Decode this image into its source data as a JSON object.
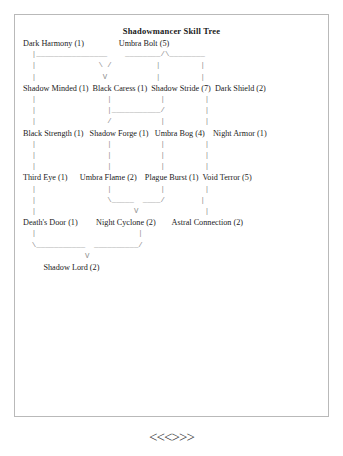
{
  "card": {
    "title": "Shadowmancer Skill Tree"
  },
  "tree": {
    "rows": [
      {
        "kind": "label",
        "text": "Dark Harmony (1)                 Umbra Bolt (5)"
      },
      {
        "kind": "conn",
        "text": "  |________________    ________/\\________"
      },
      {
        "kind": "conn",
        "text": "  |              \\ /          |         |"
      },
      {
        "kind": "conn",
        "text": "  |               V           |         |"
      },
      {
        "kind": "label",
        "text": "Shadow Minded (1)  Black Caress (1)  Shadow Stride (7)  Dark Shield (2)"
      },
      {
        "kind": "conn",
        "text": "  |                |           |         |"
      },
      {
        "kind": "conn",
        "text": "  |                |___________/         |"
      },
      {
        "kind": "conn",
        "text": "  |                /           |         |"
      },
      {
        "kind": "label",
        "text": "Black Strength (1)   Shadow Forge (1)   Umbra Bog (4)    Night Armor (1)"
      },
      {
        "kind": "conn",
        "text": "  |                |           |         |"
      },
      {
        "kind": "conn",
        "text": "  |                |           |         |"
      },
      {
        "kind": "conn",
        "text": "  |                |           |         |"
      },
      {
        "kind": "label",
        "text": "Third Eye (1)      Umbra Flame (2)    Plague Burst (1)  Void Terror (5)"
      },
      {
        "kind": "conn",
        "text": "  |                |           |         |"
      },
      {
        "kind": "conn",
        "text": "  |                \\_____  ____/        |"
      },
      {
        "kind": "conn",
        "text": "  |                      V               |"
      },
      {
        "kind": "label",
        "text": "Death's Door (1)         Night Cyclone (2)        Astral Connection (2)"
      },
      {
        "kind": "conn",
        "text": "  |                       |"
      },
      {
        "kind": "conn",
        "text": "  \\___________  __________/"
      },
      {
        "kind": "conn",
        "text": "              V"
      },
      {
        "kind": "label",
        "text": "          Shadow Lord (2)"
      }
    ],
    "nodes": [
      {
        "name": "Dark Harmony",
        "points": 1,
        "row": 1
      },
      {
        "name": "Umbra Bolt",
        "points": 5,
        "row": 1
      },
      {
        "name": "Shadow Minded",
        "points": 1,
        "row": 2
      },
      {
        "name": "Black Caress",
        "points": 1,
        "row": 2
      },
      {
        "name": "Shadow Stride",
        "points": 7,
        "row": 2
      },
      {
        "name": "Dark Shield",
        "points": 2,
        "row": 2
      },
      {
        "name": "Black Strength",
        "points": 1,
        "row": 3
      },
      {
        "name": "Shadow Forge",
        "points": 1,
        "row": 3
      },
      {
        "name": "Umbra Bog",
        "points": 4,
        "row": 3
      },
      {
        "name": "Night Armor",
        "points": 1,
        "row": 3
      },
      {
        "name": "Third Eye",
        "points": 1,
        "row": 4
      },
      {
        "name": "Umbra Flame",
        "points": 2,
        "row": 4
      },
      {
        "name": "Plague Burst",
        "points": 1,
        "row": 4
      },
      {
        "name": "Void Terror",
        "points": 5,
        "row": 4
      },
      {
        "name": "Death's Door",
        "points": 1,
        "row": 5
      },
      {
        "name": "Night Cyclone",
        "points": 2,
        "row": 5
      },
      {
        "name": "Astral Connection",
        "points": 2,
        "row": 5
      },
      {
        "name": "Shadow Lord",
        "points": 2,
        "row": 6
      }
    ]
  },
  "pager": {
    "first": "<<",
    "prev": "<",
    "next": ">",
    "last": ">>"
  }
}
